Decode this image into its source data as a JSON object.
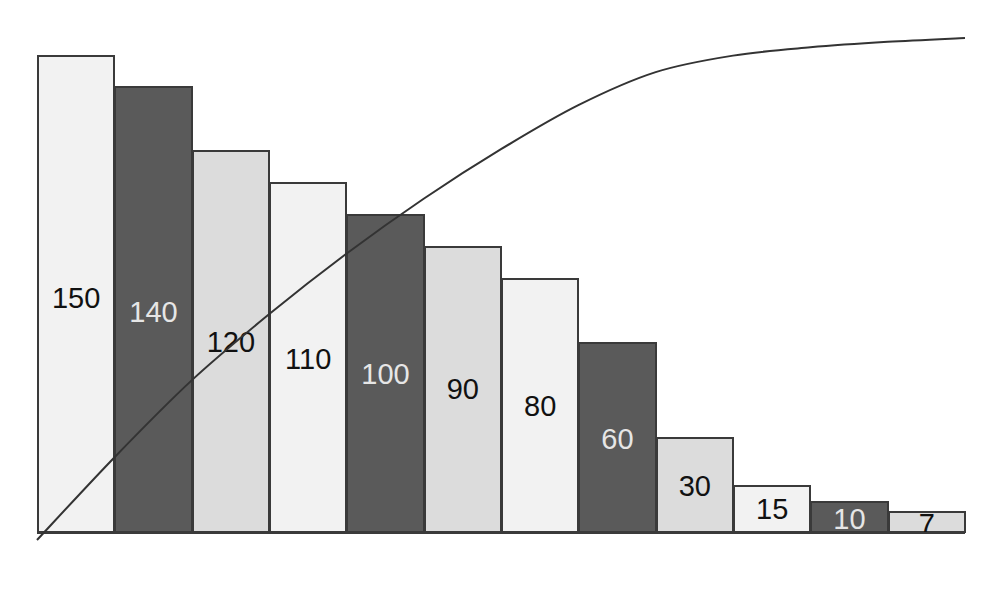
{
  "chart_data": {
    "type": "bar",
    "subtype": "pareto",
    "title": "",
    "xlabel": "",
    "ylabel": "",
    "categories": [
      "1",
      "2",
      "3",
      "4",
      "5",
      "6",
      "7",
      "8",
      "9",
      "10",
      "11",
      "12"
    ],
    "values": [
      150,
      140,
      120,
      110,
      100,
      90,
      80,
      60,
      30,
      15,
      10,
      7
    ],
    "labels": [
      "150",
      "140",
      "120",
      "110",
      "100",
      "90",
      "80",
      "60",
      "30",
      "15",
      "10",
      "7"
    ],
    "bar_fills": [
      "#f2f2f2",
      "#5a5a5a",
      "#dcdcdc",
      "#f2f2f2",
      "#5a5a5a",
      "#dcdcdc",
      "#f2f2f2",
      "#5a5a5a",
      "#dcdcdc",
      "#f2f2f2",
      "#5a5a5a",
      "#dcdcdc"
    ],
    "label_colors": [
      "#111111",
      "#e6e6e6",
      "#111111",
      "#111111",
      "#e6e6e6",
      "#111111",
      "#111111",
      "#e6e6e6",
      "#111111",
      "#111111",
      "#e6e6e6",
      "#111111"
    ],
    "label_y_offsets": [
      296,
      310,
      340,
      357,
      372,
      387,
      404,
      437,
      484,
      507,
      517,
      522
    ],
    "series": [
      {
        "name": "values",
        "type": "bar",
        "values": [
          150,
          140,
          120,
          110,
          100,
          90,
          80,
          60,
          30,
          15,
          10,
          7
        ]
      },
      {
        "name": "cumulative",
        "type": "line",
        "values": [
          150,
          290,
          410,
          520,
          620,
          710,
          790,
          850,
          880,
          895,
          905,
          912
        ]
      }
    ],
    "ylim": [
      0,
      150
    ],
    "grid": false,
    "legend": "none",
    "axes_visible": false
  },
  "layout": {
    "plot_left": 37,
    "plot_right": 965,
    "baseline_y": 533,
    "px_per_unit": 3.19
  }
}
